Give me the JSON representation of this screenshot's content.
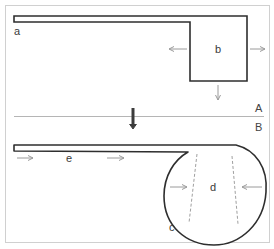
{
  "diagram": {
    "type": "two-stage cell shape schematic",
    "panel_top": {
      "label": "A",
      "labels": {
        "a": "a",
        "b": "b"
      },
      "arrows": [
        "left (from b)",
        "right (from b)",
        "down (below b)"
      ]
    },
    "panel_bottom": {
      "label": "B",
      "labels": {
        "c": "c",
        "d": "d",
        "e": "e"
      },
      "arrows": [
        "right (along e)",
        "right (along e)",
        "inward left side of d",
        "inward right side of d"
      ]
    },
    "transition_arrow": "down (A to B)",
    "colors": {
      "outline": "#2e2e2e",
      "arrow": "#9a9a9a",
      "dashed": "#a0a0a0",
      "frame": "#d0d0d0",
      "divider": "#b5b5b5",
      "transition": "#3c3c3c"
    }
  }
}
